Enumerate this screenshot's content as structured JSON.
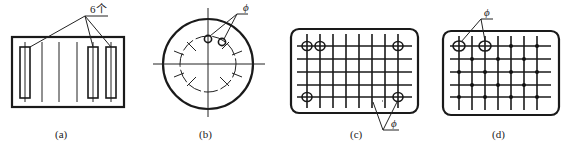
{
  "figures": [
    {
      "id": "a",
      "caption": "(a)",
      "annotation": "6个",
      "description": "Rectangular part with 3 long slot rectangles and 6 centerlines"
    },
    {
      "id": "b",
      "caption": "(b)",
      "annotation": "ϕ",
      "description": "Circular part with bolt circle of 12 radial marks, 2 small holes"
    },
    {
      "id": "c",
      "caption": "(c)",
      "annotation": "ϕ",
      "description": "Rounded rectangle grid with 4 corner holes circled"
    },
    {
      "id": "d",
      "caption": "(d)",
      "annotation": "ϕ",
      "description": "Rounded rectangle grid with dot pattern and 2 circled holes"
    }
  ]
}
